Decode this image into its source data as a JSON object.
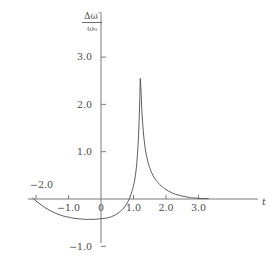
{
  "chart_data": {
    "type": "line",
    "title": "",
    "xlabel": "t",
    "ylabel_numerator": "Δω′",
    "ylabel_denominator": "ω₀",
    "xlim": [
      -2.2,
      3.45
    ],
    "ylim": [
      -1.05,
      3.35
    ],
    "grid": false,
    "legend": "none",
    "x_ticks": [
      -2.0,
      -1.0,
      0,
      1.0,
      2.0,
      3.0
    ],
    "x_tick_labels": [
      "−2.0",
      "−1.0",
      "0",
      "1.0",
      "2.0",
      "3.0"
    ],
    "y_ticks": [
      -1.0,
      1.0,
      2.0,
      3.0
    ],
    "y_tick_labels": [
      "−1.0",
      "1.0",
      "2.0",
      "3.0"
    ],
    "line_color": "#4a4a4a",
    "series": [
      {
        "name": "Δω′/ω₀",
        "x": [
          -2.1,
          -2.0,
          -1.85,
          -1.7,
          -1.55,
          -1.4,
          -1.25,
          -1.1,
          -0.95,
          -0.8,
          -0.65,
          -0.5,
          -0.35,
          -0.2,
          -0.05,
          0.1,
          0.25,
          0.4,
          0.5,
          0.6,
          0.7,
          0.8,
          0.88,
          0.95,
          1.0,
          1.05,
          1.1,
          1.14,
          1.17,
          1.19,
          1.2,
          1.21,
          1.23,
          1.26,
          1.3,
          1.35,
          1.42,
          1.5,
          1.6,
          1.7,
          1.8,
          1.9,
          2.0,
          2.15,
          2.3,
          2.45,
          2.6,
          2.75,
          2.9,
          3.1,
          3.3
        ],
        "y": [
          0.02,
          -0.04,
          -0.12,
          -0.19,
          -0.25,
          -0.3,
          -0.34,
          -0.37,
          -0.39,
          -0.41,
          -0.42,
          -0.43,
          -0.43,
          -0.43,
          -0.42,
          -0.41,
          -0.39,
          -0.35,
          -0.31,
          -0.26,
          -0.19,
          -0.09,
          0.02,
          0.16,
          0.28,
          0.46,
          0.75,
          1.15,
          1.6,
          2.05,
          2.35,
          2.55,
          2.3,
          1.85,
          1.45,
          1.12,
          0.85,
          0.66,
          0.5,
          0.39,
          0.31,
          0.25,
          0.2,
          0.14,
          0.1,
          0.07,
          0.05,
          0.03,
          0.02,
          0.01,
          0.01
        ]
      }
    ],
    "annotations": {
      "peak_t": 1.21,
      "peak_value": 2.55,
      "trough_t": 0.25,
      "trough_value": -0.43
    }
  }
}
